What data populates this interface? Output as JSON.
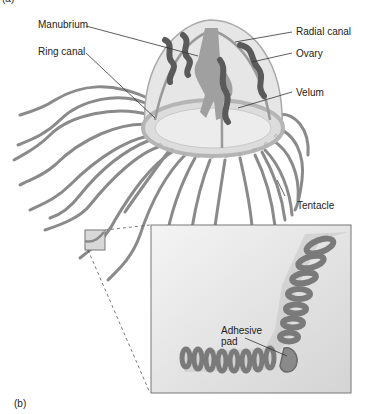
{
  "figure": {
    "panel_a_label": "(a)",
    "panel_b_label": "(b)",
    "colors": {
      "background": "#ffffff",
      "bell_fill": "#e6e6e6",
      "bell_stroke": "#aaaaaa",
      "organ_dark": "#5a5a5a",
      "manubrium": "#a0a0a0",
      "tentacle": "#8a8a8a",
      "inset_bg": "#e4e4e4",
      "inset_border": "#777777",
      "leader_line": "#333333"
    }
  },
  "labels": {
    "manubrium": "Manubrium",
    "ring_canal": "Ring canal",
    "radial_canal": "Radial canal",
    "ovary": "Ovary",
    "velum": "Velum",
    "tentacle": "Tentacle",
    "adhesive_pad": "Adhesive",
    "adhesive_pad_line2": "pad"
  }
}
